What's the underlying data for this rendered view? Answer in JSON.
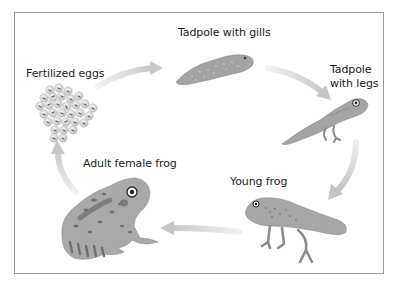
{
  "diagram": {
    "cycle_direction": "clockwise",
    "stages": [
      {
        "id": "eggs",
        "label": "Fertilized eggs",
        "icon": "egg-cluster-icon"
      },
      {
        "id": "tadpole_gills",
        "label": "Tadpole with gills",
        "icon": "tadpole-icon"
      },
      {
        "id": "tadpole_legs",
        "label_line1": "Tadpole",
        "label_line2": "with legs",
        "icon": "tadpole-with-legs-icon"
      },
      {
        "id": "young_frog",
        "label": "Young frog",
        "icon": "young-frog-icon"
      },
      {
        "id": "adult_frog",
        "label": "Adult female frog",
        "icon": "adult-frog-icon"
      }
    ],
    "arrows": [
      {
        "from": "eggs",
        "to": "tadpole_gills"
      },
      {
        "from": "tadpole_gills",
        "to": "tadpole_legs"
      },
      {
        "from": "tadpole_legs",
        "to": "young_frog"
      },
      {
        "from": "young_frog",
        "to": "adult_frog"
      },
      {
        "from": "adult_frog",
        "to": "eggs"
      }
    ],
    "colors": {
      "frame": "#9a9a9a",
      "arrow": "#d2d2d2",
      "body": "#a9a9a9",
      "body_dark": "#7d7d7d",
      "spots": "#6a6a6a",
      "text": "#1a1a1a"
    }
  }
}
